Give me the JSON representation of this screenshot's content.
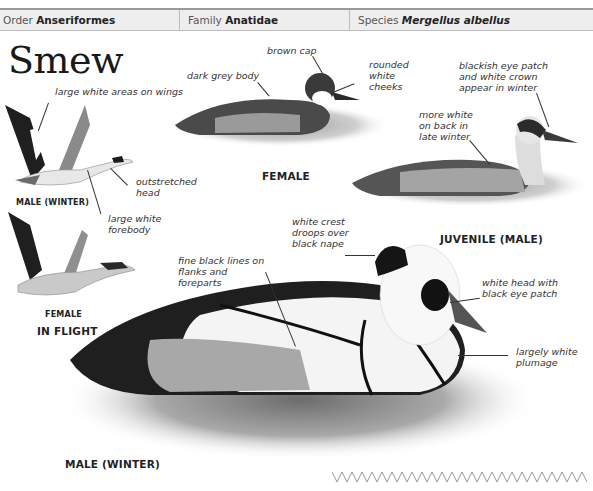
{
  "header": {
    "order_label": "Order",
    "order_value": "Anseriformes",
    "family_label": "Family",
    "family_value": "Anatidae",
    "species_label": "Species",
    "species_value": "Mergellus albellus"
  },
  "title": "Smew",
  "illustrations": {
    "flight_male": {
      "caption": "MALE (WINTER)",
      "annotations": [
        "large white areas on wings",
        "outstretched head",
        "large white forebody"
      ]
    },
    "flight_female": {
      "caption": "FEMALE"
    },
    "flight_group_caption": "IN FLIGHT",
    "female": {
      "caption": "FEMALE",
      "annotations": [
        "brown cap",
        "dark grey body",
        "rounded white cheeks"
      ]
    },
    "juvenile_male": {
      "caption": "JUVENILE (MALE)",
      "annotations": [
        "blackish eye patch and white crown appear in winter",
        "more white on back in late winter"
      ]
    },
    "male_winter": {
      "caption": "MALE (WINTER)",
      "annotations": [
        "white crest droops over black nape",
        "fine black lines on flanks and foreparts",
        "white head with black eye patch",
        "largely white plumage"
      ]
    }
  },
  "icons": {
    "decorative_zigzag": "zigzag-divider-icon"
  },
  "colors": {
    "header_bg": "#eeeeee",
    "header_border": "#9a9a9a",
    "text": "#333333"
  }
}
